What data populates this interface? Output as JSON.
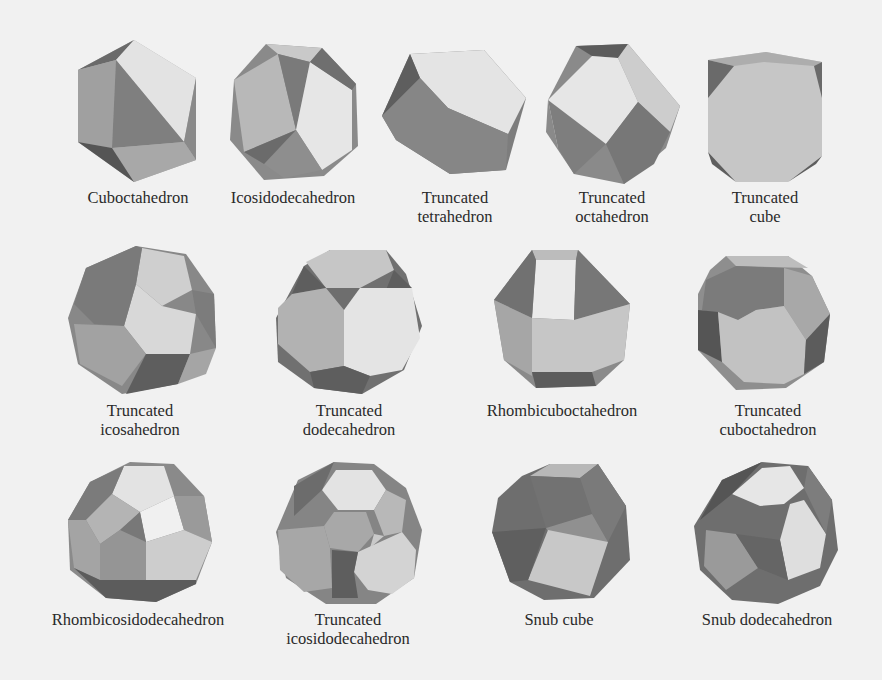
{
  "figure": {
    "colors": {
      "background": "#f1f1f1",
      "face_light": "#e6e6e6",
      "face_mid": "#b8b8b8",
      "face_midlight": "#cfcfcf",
      "face_dark": "#7c7c7c",
      "face_darker": "#5e5e5e",
      "text": "#2a2a2a"
    },
    "rows": [
      {
        "items": [
          {
            "id": "cuboctahedron",
            "line1": "Cuboctahedron",
            "line2": ""
          },
          {
            "id": "icosidodecahedron",
            "line1": "Icosidodecahedron",
            "line2": ""
          },
          {
            "id": "truncated-tetrahedron",
            "line1": "Truncated",
            "line2": "tetrahedron"
          },
          {
            "id": "truncated-octahedron",
            "line1": "Truncated",
            "line2": "octahedron"
          },
          {
            "id": "truncated-cube",
            "line1": "Truncated",
            "line2": "cube"
          }
        ]
      },
      {
        "items": [
          {
            "id": "truncated-icosahedron",
            "line1": "Truncated",
            "line2": "icosahedron"
          },
          {
            "id": "truncated-dodecahedron",
            "line1": "Truncated",
            "line2": "dodecahedron"
          },
          {
            "id": "rhombicuboctahedron",
            "line1": "Rhombicuboctahedron",
            "line2": ""
          },
          {
            "id": "truncated-cuboctahedron",
            "line1": "Truncated",
            "line2": "cuboctahedron"
          }
        ]
      },
      {
        "items": [
          {
            "id": "rhombicosidodecahedron",
            "line1": "Rhombicosidodecahedron",
            "line2": ""
          },
          {
            "id": "truncated-icosidodecahedron",
            "line1": "Truncated",
            "line2": "icosidodecahedron"
          },
          {
            "id": "snub-cube",
            "line1": "Snub cube",
            "line2": ""
          },
          {
            "id": "snub-dodecahedron",
            "line1": "Snub dodecahedron",
            "line2": ""
          }
        ]
      }
    ]
  }
}
